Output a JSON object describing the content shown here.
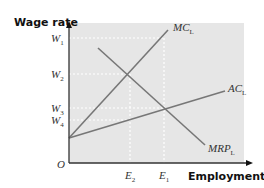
{
  "chart_data": {
    "type": "line",
    "title": "",
    "xlabel": "Employment",
    "ylabel": "Wage rate",
    "origin_label": "O",
    "grid": false,
    "background_color": "#e6e6e6",
    "line_color": "#777777",
    "axis_color": "#333333",
    "y_ticks": [
      {
        "label": "W",
        "sub": "1",
        "px_y": 38
      },
      {
        "label": "W",
        "sub": "2",
        "px_y": 74
      },
      {
        "label": "W",
        "sub": "3",
        "px_y": 108
      },
      {
        "label": "W",
        "sub": "4",
        "px_y": 120
      }
    ],
    "x_ticks": [
      {
        "label": "E",
        "sub": "2",
        "px_x": 130
      },
      {
        "label": "E",
        "sub": "1",
        "px_x": 164
      }
    ],
    "series": [
      {
        "name": "MC",
        "sub": "L",
        "points_px": [
          [
            69,
            138
          ],
          [
            168,
            30
          ]
        ],
        "label_px": [
          173,
          31
        ]
      },
      {
        "name": "AC",
        "sub": "L",
        "points_px": [
          [
            69,
            138
          ],
          [
            225,
            91
          ]
        ],
        "label_px": [
          228,
          92
        ]
      },
      {
        "name": "MRP",
        "sub": "L",
        "points_px": [
          [
            98,
            48
          ],
          [
            205,
            145
          ]
        ],
        "label_px": [
          208,
          152
        ]
      }
    ],
    "dashed_guides": [
      {
        "from_px": [
          69,
          38
        ],
        "to_px": [
          164,
          38
        ]
      },
      {
        "from_px": [
          69,
          74
        ],
        "to_px": [
          130,
          74
        ]
      },
      {
        "from_px": [
          69,
          108
        ],
        "to_px": [
          164,
          108
        ]
      },
      {
        "from_px": [
          69,
          120
        ],
        "to_px": [
          130,
          120
        ]
      },
      {
        "from_px": [
          130,
          74
        ],
        "to_px": [
          130,
          163
        ]
      },
      {
        "from_px": [
          164,
          38
        ],
        "to_px": [
          164,
          163
        ]
      }
    ],
    "intersections": [
      {
        "curves": [
          "MC_L",
          "MRP_L"
        ],
        "wage": "W2",
        "employment": "E2"
      },
      {
        "curves": [
          "AC_L",
          "MRP_L"
        ],
        "wage": "W3",
        "employment": "E1"
      }
    ]
  }
}
